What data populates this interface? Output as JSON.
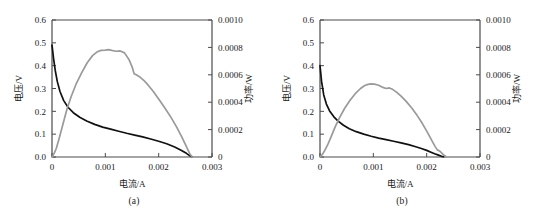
{
  "figure": {
    "background": "#ffffff",
    "voltage_color": "#111111",
    "power_color": "#9a9a9a",
    "axis_color": "#4a4a4a"
  },
  "panels": [
    {
      "caption": "(a)",
      "chart_data": {
        "type": "line",
        "title": "",
        "xlabel": "电流/A",
        "ylabel": "电压/V",
        "y2label": "功率/W",
        "xlim": [
          0,
          0.003
        ],
        "ylim": [
          0.0,
          0.6
        ],
        "y2lim": [
          0,
          0.001
        ],
        "xticks": [
          "0",
          "0.001",
          "0.002",
          "0.003"
        ],
        "xtick_values": [
          0,
          0.001,
          0.002,
          0.003
        ],
        "yticks": [
          "0.0",
          "0.1",
          "0.2",
          "0.3",
          "0.4",
          "0.5",
          "0.6"
        ],
        "ytick_values": [
          0.0,
          0.1,
          0.2,
          0.3,
          0.4,
          0.5,
          0.6
        ],
        "y2ticks": [
          "0",
          "0.0002",
          "0.0004",
          "0.0006",
          "0.0008",
          "0.0010"
        ],
        "y2tick_values": [
          0,
          0.0002,
          0.0004,
          0.0006,
          0.0008,
          0.001
        ],
        "grid": false,
        "legend": "none",
        "series": [
          {
            "name": "电压/V",
            "axis": "left",
            "color": "#111111",
            "x": [
              0.0,
              3e-05,
              6e-05,
              0.0001,
              0.00015,
              0.00022,
              0.0003,
              0.0004,
              0.00052,
              0.00065,
              0.0008,
              0.00095,
              0.0011,
              0.00125,
              0.0014,
              0.00155,
              0.0017,
              0.00185,
              0.002,
              0.00215,
              0.0023,
              0.00242,
              0.00252,
              0.00258,
              0.00262
            ],
            "y": [
              0.49,
              0.43,
              0.38,
              0.33,
              0.287,
              0.247,
              0.218,
              0.194,
              0.174,
              0.158,
              0.143,
              0.131,
              0.122,
              0.113,
              0.104,
              0.096,
              0.088,
              0.079,
              0.069,
              0.058,
              0.044,
              0.03,
              0.016,
              0.006,
              0.002
            ]
          },
          {
            "name": "功率/W",
            "axis": "right",
            "color": "#9a9a9a",
            "x": [
              0.0,
              2e-05,
              4e-05,
              8e-05,
              0.00013,
              0.0002,
              0.00028,
              0.00036,
              0.00046,
              0.00056,
              0.00066,
              0.00076,
              0.00084,
              0.00092,
              0.001,
              0.00106,
              0.00112,
              0.0012,
              0.00128,
              0.00136,
              0.00144,
              0.0015,
              0.00154,
              0.00158,
              0.00164,
              0.00172,
              0.0018,
              0.0019,
              0.002,
              0.00212,
              0.00224,
              0.00234,
              0.00244,
              0.00252,
              0.00258,
              0.00262
            ],
            "y": [
              0.0,
              1.2e-05,
              2.6e-05,
              6.2e-05,
              0.00013,
              0.000232,
              0.000348,
              0.000442,
              0.00054,
              0.000618,
              0.000688,
              0.00074,
              0.000766,
              0.000778,
              0.00078,
              0.000784,
              0.000778,
              0.000772,
              0.000774,
              0.00076,
              0.000714,
              0.00066,
              0.000608,
              0.0006,
              0.000586,
              0.00056,
              0.000526,
              0.000478,
              0.000424,
              0.000356,
              0.000284,
              0.000216,
              0.000142,
              7.6e-05,
              2.6e-05,
              4e-06
            ]
          }
        ]
      }
    },
    {
      "caption": "(b)",
      "chart_data": {
        "type": "line",
        "title": "",
        "xlabel": "电流/A",
        "ylabel": "电压/V",
        "y2label": "功率/W",
        "xlim": [
          0,
          0.003
        ],
        "ylim": [
          0.0,
          0.6
        ],
        "y2lim": [
          0,
          0.001
        ],
        "xticks": [
          "0",
          "0.001",
          "0.002",
          "0.003"
        ],
        "xtick_values": [
          0,
          0.001,
          0.002,
          0.003
        ],
        "yticks": [
          "0.0",
          "0.1",
          "0.2",
          "0.3",
          "0.4",
          "0.5",
          "0.6"
        ],
        "ytick_values": [
          0.0,
          0.1,
          0.2,
          0.3,
          0.4,
          0.5,
          0.6
        ],
        "y2ticks": [
          "0",
          "0.0002",
          "0.0004",
          "0.0006",
          "0.0008",
          "0.0010"
        ],
        "y2tick_values": [
          0,
          0.0002,
          0.0004,
          0.0006,
          0.0008,
          0.001
        ],
        "grid": false,
        "legend": "none",
        "series": [
          {
            "name": "电压/V",
            "axis": "left",
            "color": "#111111",
            "x": [
              0.0,
              3e-05,
              7e-05,
              0.00012,
              0.00018,
              0.00026,
              0.00034,
              0.00044,
              0.00055,
              0.00068,
              0.00082,
              0.00096,
              0.0011,
              0.00124,
              0.00138,
              0.00152,
              0.00166,
              0.00178,
              0.0019,
              0.002,
              0.00208,
              0.00215,
              0.00222,
              0.00228,
              0.00232
            ],
            "y": [
              0.4,
              0.33,
              0.272,
              0.232,
              0.202,
              0.176,
              0.157,
              0.139,
              0.124,
              0.111,
              0.1,
              0.091,
              0.083,
              0.076,
              0.069,
              0.062,
              0.054,
              0.046,
              0.037,
              0.029,
              0.021,
              0.014,
              0.008,
              0.003,
              0.001
            ]
          },
          {
            "name": "功率/W",
            "axis": "right",
            "color": "#9a9a9a",
            "x": [
              0.0,
              2e-05,
              5e-05,
              9e-05,
              0.00014,
              0.0002,
              0.00028,
              0.00036,
              0.00046,
              0.00056,
              0.00066,
              0.00076,
              0.00084,
              0.0009,
              0.00096,
              0.00102,
              0.0011,
              0.00118,
              0.00124,
              0.0013,
              0.00136,
              0.00144,
              0.00152,
              0.00162,
              0.00172,
              0.00182,
              0.00192,
              0.00202,
              0.0021,
              0.00216,
              0.0022,
              0.00224,
              0.00228,
              0.00232,
              0.00236
            ],
            "y": [
              0.0,
              8e-06,
              2.2e-05,
              4.8e-05,
              8.6e-05,
              0.00014,
              0.000216,
              0.000282,
              0.000354,
              0.000412,
              0.000462,
              0.0005,
              0.000522,
              0.00053,
              0.000534,
              0.000532,
              0.000524,
              0.000508,
              0.0005,
              0.000504,
              0.000494,
              0.000472,
              0.000444,
              0.000404,
              0.000358,
              0.000304,
              0.000244,
              0.000176,
              0.000118,
              7.6e-05,
              5.2e-05,
              4.4e-05,
              3e-05,
              1.4e-05,
              4e-06
            ]
          }
        ]
      }
    }
  ]
}
